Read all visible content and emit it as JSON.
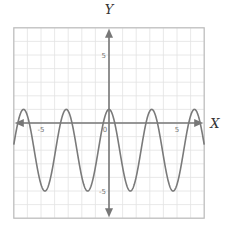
{
  "chart_data": {
    "type": "line",
    "title": "",
    "xlabel": "X",
    "ylabel": "Y",
    "xlim": [
      -7,
      7
    ],
    "ylim": [
      -7,
      7
    ],
    "grid": true,
    "grid_step": 1,
    "x_ticks": [
      {
        "value": -5,
        "label": "-5"
      },
      {
        "value": 0,
        "label": "0"
      },
      {
        "value": 5,
        "label": "5"
      }
    ],
    "y_ticks": [
      {
        "value": 5,
        "label": "5"
      },
      {
        "value": -5,
        "label": "-5"
      }
    ],
    "series": [
      {
        "name": "y = 3cos(2x) - 2",
        "function": "3*cos(2*x) - 2",
        "amplitude": 3,
        "vertical_shift": -2,
        "period": 3.14159,
        "max": 1,
        "min": -5,
        "x": [
          -6.8,
          -6.28,
          -5.5,
          -4.71,
          -3.93,
          -3.14,
          -2.36,
          -1.57,
          -0.79,
          0,
          0.79,
          1.57,
          2.36,
          3.14,
          3.93,
          4.71,
          5.5,
          6.28,
          7.0
        ],
        "values": [
          -1.4,
          1,
          -2,
          -5,
          -2,
          1,
          -2,
          -5,
          -2,
          1,
          -2,
          -5,
          -2,
          1,
          -2,
          -5,
          -2,
          1,
          -2.4
        ],
        "color": "#7a7a7a"
      }
    ],
    "legend": null
  },
  "colors": {
    "grid": "#e2e2e2",
    "frame": "#bdbdbd",
    "axis": "#777777",
    "curve": "#7a7a7a"
  }
}
